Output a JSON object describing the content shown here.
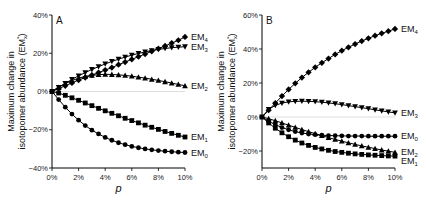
{
  "chart_data": [
    {
      "type": "line",
      "panel": "A",
      "title": "",
      "xlabel": "p",
      "ylabel": "Maximum change in isotopomer abundance (EM*x)",
      "x": [
        0,
        0.5,
        1,
        1.5,
        2,
        2.5,
        3,
        3.5,
        4,
        4.5,
        5,
        5.5,
        6,
        6.5,
        7,
        7.5,
        8,
        8.5,
        9,
        9.5,
        10
      ],
      "x_ticks": [
        "0%",
        "2%",
        "4%",
        "6%",
        "8%",
        "10%"
      ],
      "y_ticks": [
        "-40%",
        "-20%",
        "0%",
        "20%",
        "40%"
      ],
      "xlim": [
        0,
        10
      ],
      "ylim": [
        -40,
        40
      ],
      "series": [
        {
          "name": "EM4",
          "label": "EM",
          "sub": "4",
          "marker": "diamond",
          "values": [
            0,
            1.5,
            3,
            4.5,
            6,
            7.3,
            8.6,
            9.9,
            11.2,
            12.5,
            14,
            15.4,
            16.8,
            18.2,
            19.6,
            21,
            22.4,
            23.8,
            25.3,
            26.8,
            28.5
          ]
        },
        {
          "name": "EM3",
          "label": "EM",
          "sub": "3",
          "marker": "triangle-down",
          "values": [
            0,
            2.2,
            4.3,
            6.3,
            8.2,
            9.9,
            11.5,
            13,
            14.4,
            15.7,
            16.9,
            18,
            19,
            19.9,
            20.7,
            21.4,
            22,
            22.5,
            22.9,
            23.2,
            23.4
          ]
        },
        {
          "name": "EM2",
          "label": "EM",
          "sub": "2",
          "marker": "triangle-up",
          "values": [
            0,
            2.2,
            4.1,
            5.7,
            7,
            7.9,
            8.5,
            8.8,
            9,
            8.9,
            8.7,
            8.4,
            8,
            7.5,
            7,
            6.4,
            5.8,
            5.1,
            4.4,
            3.7,
            3
          ]
        },
        {
          "name": "EM1",
          "label": "EM",
          "sub": "1",
          "marker": "square",
          "values": [
            0,
            -0.8,
            -2,
            -3.3,
            -4.6,
            -6,
            -7.4,
            -8.8,
            -10.1,
            -11.4,
            -12.7,
            -14,
            -15.2,
            -16.4,
            -17.6,
            -18.7,
            -19.8,
            -20.9,
            -21.9,
            -22.9,
            -23.8
          ]
        },
        {
          "name": "EM0",
          "label": "EM",
          "sub": "0",
          "marker": "circle",
          "values": [
            0,
            -4.2,
            -8.2,
            -11.8,
            -15,
            -17.8,
            -20.2,
            -22.2,
            -24,
            -25.5,
            -26.8,
            -27.8,
            -28.7,
            -29.4,
            -30,
            -30.5,
            -30.9,
            -31.2,
            -31.5,
            -31.7,
            -31.9
          ]
        }
      ],
      "grid": false,
      "zero_line": true,
      "legend": "inline-right"
    },
    {
      "type": "line",
      "panel": "B",
      "title": "",
      "xlabel": "p",
      "ylabel": "Maximum change in isotopomer abundance (EM*x)",
      "x": [
        0,
        0.5,
        1,
        1.5,
        2,
        2.5,
        3,
        3.5,
        4,
        4.5,
        5,
        5.5,
        6,
        6.5,
        7,
        7.5,
        8,
        8.5,
        9,
        9.5,
        10
      ],
      "x_ticks": [
        "0%",
        "2%",
        "4%",
        "6%",
        "8%",
        "10%"
      ],
      "y_ticks": [
        "-20%",
        "0%",
        "20%",
        "40%",
        "60%"
      ],
      "xlim": [
        0,
        10
      ],
      "ylim": [
        -30,
        60
      ],
      "series": [
        {
          "name": "EM4",
          "label": "EM",
          "sub": "4",
          "marker": "diamond",
          "values": [
            0,
            4,
            8.2,
            12.3,
            16.2,
            19.8,
            23.2,
            26.3,
            29.2,
            31.9,
            34.4,
            36.8,
            39,
            41,
            42.9,
            44.7,
            46.3,
            47.8,
            49.2,
            50.5,
            51.8
          ]
        },
        {
          "name": "EM3",
          "label": "EM",
          "sub": "3",
          "marker": "triangle-down",
          "values": [
            0,
            4.5,
            6.8,
            8.2,
            8.9,
            9.2,
            9.3,
            9.2,
            9,
            8.7,
            8.3,
            7.8,
            7.3,
            6.7,
            6.1,
            5.5,
            4.9,
            4.2,
            3.6,
            3,
            2.4
          ]
        },
        {
          "name": "EM0",
          "label": "EM",
          "sub": "0",
          "marker": "circle",
          "values": [
            0,
            -2.5,
            -4.5,
            -6.2,
            -7.5,
            -8.6,
            -9.4,
            -10,
            -10.4,
            -10.7,
            -10.9,
            -11,
            -11.1,
            -11.2,
            -11.2,
            -11.2,
            -11.3,
            -11.3,
            -11.3,
            -11.3,
            -11.3
          ]
        },
        {
          "name": "EM2",
          "label": "EM",
          "sub": "2",
          "marker": "triangle-up",
          "values": [
            0,
            -1,
            -2.2,
            -3.5,
            -4.8,
            -6.1,
            -7.4,
            -8.6,
            -9.8,
            -11,
            -12.1,
            -13.2,
            -14.2,
            -15.2,
            -16.1,
            -17,
            -17.8,
            -18.6,
            -19.4,
            -20.1,
            -20.8
          ]
        },
        {
          "name": "EM1",
          "label": "EM",
          "sub": "1",
          "marker": "square",
          "values": [
            0,
            -3.5,
            -6.6,
            -9.3,
            -11.6,
            -13.6,
            -15.3,
            -16.7,
            -17.9,
            -18.8,
            -19.6,
            -20.3,
            -20.8,
            -21.3,
            -21.7,
            -22,
            -22.3,
            -22.5,
            -22.7,
            -22.9,
            -23
          ]
        }
      ],
      "grid": false,
      "zero_line": true,
      "legend": "inline-right"
    }
  ],
  "labels": {
    "panelA": "A",
    "panelB": "B",
    "ylabel_line1": "Maximum change in",
    "ylabel_line2": "isotopomer abundance (EM",
    "ylabel_sub": "x",
    "ylabel_sup": "*",
    "ylabel_close": ")",
    "xlabel": "p"
  }
}
